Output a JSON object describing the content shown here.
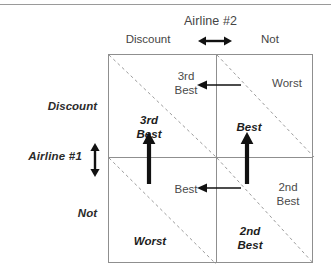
{
  "figure": {
    "column_player": "Airline #2",
    "row_player": "Airline #1",
    "column_strategies": [
      "Discount",
      "Not"
    ],
    "row_strategies": [
      "Discount",
      "Not"
    ]
  },
  "cells": {
    "discount_discount": {
      "row_payoff": "3rd\nBest",
      "col_payoff": "3rd\nBest"
    },
    "discount_not": {
      "row_payoff": "Best",
      "col_payoff": "Worst"
    },
    "not_discount": {
      "row_payoff": "Worst",
      "col_payoff": "Best"
    },
    "not_not": {
      "row_payoff": "2nd\nBest",
      "col_payoff": "2nd\nBest"
    }
  },
  "best_response_arrows": {
    "row_player_up_left_column": "up-arrow",
    "row_player_up_right_column": "up-arrow",
    "col_player_top_row": "left-arrow",
    "col_player_bottom_row": "left-arrow"
  },
  "legend": {
    "horizontal_selector": "double-headed-horizontal-arrow",
    "vertical_selector": "double-headed-vertical-arrow"
  },
  "colors": {
    "grid_line": "#8f8f8f",
    "diagonal_line": "#9b9b9b",
    "arrow": "#111111",
    "row_payoff_text": "#1d1d1d",
    "col_payoff_text": "#4a4a4a"
  }
}
